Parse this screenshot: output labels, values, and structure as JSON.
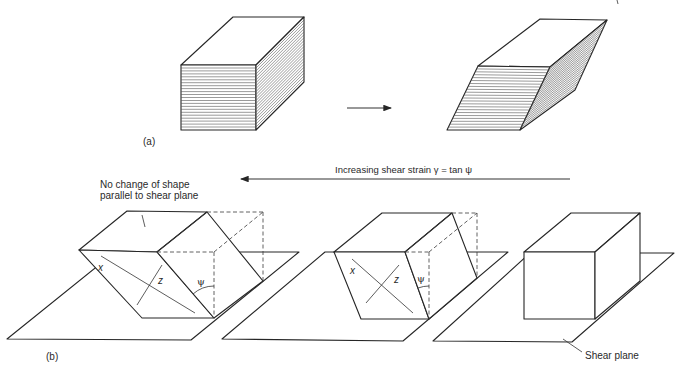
{
  "figure": {
    "panel_a": {
      "label": "(a)"
    },
    "panel_b": {
      "label": "(b)",
      "direction_caption": "Increasing shear strain γ = tan ψ",
      "annotation_lines": [
        "No change of shape",
        "parallel to shear plane"
      ],
      "shear_plane_label": "Shear plane",
      "block_labels": {
        "x": "x",
        "z": "z",
        "angle": "ψ"
      }
    },
    "stages": [
      "highly sheared block",
      "moderately sheared block",
      "undeformed block"
    ]
  }
}
